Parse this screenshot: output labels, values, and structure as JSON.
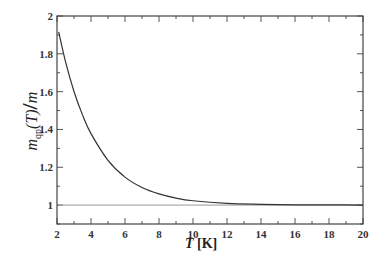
{
  "chart_data": {
    "type": "line",
    "title": "",
    "xlabel": "T [K]",
    "ylabel": "m_qp(T) / m",
    "xlim": [
      2,
      20
    ],
    "ylim": [
      0.9,
      2.0
    ],
    "x_ticks": [
      2,
      4,
      6,
      8,
      10,
      12,
      14,
      16,
      18,
      20
    ],
    "y_ticks": [
      1,
      1.2,
      1.4,
      1.6,
      1.8,
      2
    ],
    "x_tick_labels": [
      "2",
      "4",
      "6",
      "8",
      "10",
      "12",
      "14",
      "16",
      "18",
      "20"
    ],
    "y_tick_labels": [
      "1",
      "1.2",
      "1.4",
      "1.6",
      "1.8",
      "2"
    ],
    "grid": false,
    "legend": null,
    "series": [
      {
        "name": "m_qp(T)/m",
        "color": "#333333",
        "x": [
          2.1,
          2.5,
          3,
          3.5,
          4,
          5,
          6,
          7,
          8,
          9,
          10,
          12,
          14,
          16,
          18,
          20
        ],
        "values": [
          1.916,
          1.759,
          1.601,
          1.477,
          1.378,
          1.237,
          1.148,
          1.093,
          1.059,
          1.037,
          1.023,
          1.009,
          1.004,
          1.001,
          1.001,
          1.0
        ]
      },
      {
        "name": "reference y=1",
        "color": "#999999",
        "x": [
          2,
          20
        ],
        "values": [
          1,
          1
        ]
      }
    ]
  },
  "labels": {
    "x_var": "T",
    "x_unit": "[K]",
    "y_var": "m",
    "y_sub": "qp",
    "y_arg": "(T)",
    "y_denom": "m"
  }
}
